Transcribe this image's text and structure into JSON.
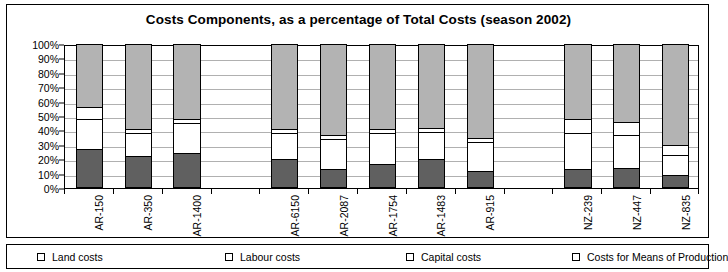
{
  "chart_data": {
    "type": "bar",
    "subtype": "stacked-percentage-column",
    "title": "Costs Components, as a percentage of Total Costs (season 2002)",
    "xlabel": "",
    "ylabel": "",
    "ylim": [
      0,
      100
    ],
    "ytick_labels": [
      "0%",
      "10%",
      "20%",
      "30%",
      "40%",
      "50%",
      "60%",
      "70%",
      "80%",
      "90%",
      "100%"
    ],
    "ytick_values": [
      0,
      10,
      20,
      30,
      40,
      50,
      60,
      70,
      80,
      90,
      100
    ],
    "grid": true,
    "legend_position": "bottom",
    "categories": [
      "AR-150",
      "AR-350",
      "AR-1400",
      "",
      "AR-6150",
      "AR-2087",
      "AR-1754",
      "AR-1483",
      "AR-915",
      "",
      "NZ-239",
      "NZ-447",
      "NZ-835"
    ],
    "series": [
      {
        "name": "Land costs",
        "color": "#606060",
        "values": [
          27,
          22,
          24,
          null,
          20,
          13,
          17,
          20,
          12,
          null,
          13,
          14,
          9
        ]
      },
      {
        "name": "Labour costs",
        "color": "#ffffff",
        "values": [
          21,
          16,
          21,
          null,
          18,
          21,
          21,
          19,
          20,
          null,
          25,
          23,
          14
        ]
      },
      {
        "name": "Capital costs",
        "color": "#ffffff",
        "values": [
          8,
          3,
          3,
          null,
          3,
          3,
          3,
          3,
          3,
          null,
          10,
          9,
          7
        ]
      },
      {
        "name": "Costs for Means of Production",
        "color": "#b3b3b3",
        "values": [
          44,
          59,
          52,
          null,
          59,
          63,
          59,
          58,
          65,
          null,
          52,
          54,
          70
        ]
      }
    ]
  },
  "legend": {
    "items": [
      {
        "label": "Land costs",
        "color": "#606060"
      },
      {
        "label": "Labour costs",
        "color": "#ffffff"
      },
      {
        "label": "Capital costs",
        "color": "#ffffff"
      },
      {
        "label": "Costs for Means of Production",
        "color": "#b3b3b3"
      }
    ]
  }
}
